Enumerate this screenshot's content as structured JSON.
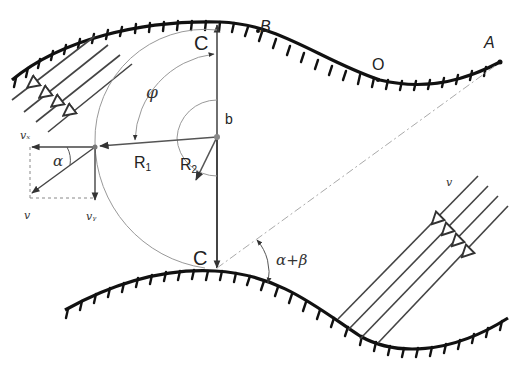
{
  "diagram": {
    "labels": {
      "C_top": "C",
      "C_bottom": "C",
      "B": "B",
      "O": "O",
      "A": "A",
      "b": "b",
      "phi": "φ",
      "R1": "R",
      "R1_sub": "1",
      "R2": "R",
      "R2_sub": "2",
      "alpha": "α",
      "alpha_beta": "α+β",
      "v_x": "vₓ",
      "v": "v",
      "v_y": "vᵧ",
      "v_right": "v"
    },
    "colors": {
      "wall": "#111111",
      "thin_line": "#555555",
      "light_line": "#999999",
      "stream": "#444444"
    }
  }
}
